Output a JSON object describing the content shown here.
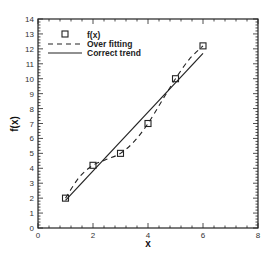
{
  "chart_data": {
    "type": "line",
    "title": "",
    "xlabel": "x",
    "ylabel": "f(x)",
    "xlim": [
      0,
      8
    ],
    "ylim": [
      0,
      14
    ],
    "xticks": [
      0,
      2,
      4,
      6,
      8
    ],
    "yticks": [
      0,
      1,
      2,
      3,
      4,
      5,
      6,
      7,
      8,
      9,
      10,
      11,
      12,
      13,
      14
    ],
    "grid": false,
    "legend_position": "upper left",
    "series": [
      {
        "name": "f(x)",
        "style": "square-markers",
        "x": [
          1,
          2,
          3,
          4,
          5,
          6
        ],
        "y": [
          2.0,
          4.2,
          5.0,
          7.0,
          10.0,
          12.2
        ]
      },
      {
        "name": "Over fitting",
        "style": "dashed",
        "x": [
          1,
          1.5,
          2,
          2.5,
          3,
          3.5,
          4,
          4.5,
          5,
          5.5,
          6
        ],
        "y": [
          2.0,
          3.4,
          4.2,
          4.6,
          5.0,
          5.8,
          7.0,
          8.5,
          10.0,
          11.3,
          12.2
        ]
      },
      {
        "name": "Correct trend",
        "style": "solid",
        "x": [
          1,
          6
        ],
        "y": [
          1.85,
          11.7
        ]
      }
    ]
  },
  "legend": {
    "items": [
      {
        "label": "f(x)",
        "symbol": "square"
      },
      {
        "label": "Over fitting",
        "symbol": "dashed-line"
      },
      {
        "label": "Correct trend",
        "symbol": "solid-line"
      }
    ]
  },
  "axes": {
    "xlabel": "x",
    "ylabel": "f(x)",
    "xtick_labels": [
      "0",
      "2",
      "4",
      "6",
      "8"
    ],
    "ytick_labels": [
      "0",
      "1",
      "2",
      "3",
      "4",
      "5",
      "6",
      "7",
      "8",
      "9",
      "10",
      "11",
      "12",
      "13",
      "14"
    ]
  }
}
